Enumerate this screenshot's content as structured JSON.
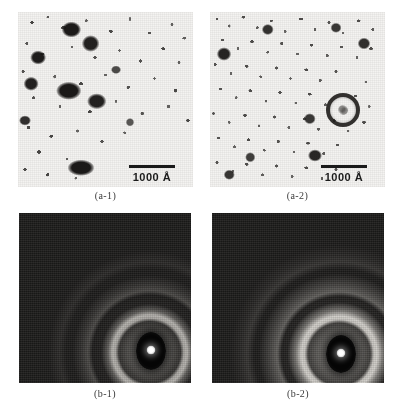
{
  "figure": {
    "type": "micrograph-panel-figure",
    "layout": "2x2",
    "background_color": "#ffffff",
    "panels": [
      {
        "id": "a-1",
        "caption": "(a-1)",
        "kind": "tem-bright-field-micrograph",
        "description": "Bright-field TEM micrograph showing large dark precipitate particles dispersed in a fine speckled matrix",
        "scalebar": {
          "label": "1000 Å",
          "length_value": 1000,
          "length_unit": "Å"
        }
      },
      {
        "id": "a-2",
        "caption": "(a-2)",
        "kind": "tem-bright-field-micrograph",
        "description": "Bright-field TEM micrograph with a finer, more uniform nanocrystalline speckle texture and one hollow ring-shaped particle",
        "scalebar": {
          "label": "1000 Å",
          "length_value": 1000,
          "length_unit": "Å"
        }
      },
      {
        "id": "b-1",
        "caption": "(b-1)",
        "kind": "selected-area-electron-diffraction-pattern",
        "description": "Electron diffraction pattern with faint diffuse halo rings and a beam stop over the transmitted spot"
      },
      {
        "id": "b-2",
        "caption": "(b-2)",
        "kind": "selected-area-electron-diffraction-pattern",
        "description": "Electron diffraction pattern with brighter, more distinct Debye-Scherrer rings and a beam stop over the transmitted spot"
      }
    ],
    "colors": {
      "page_background": "#ffffff",
      "micrograph_background": "#f4f3f1",
      "particle_dark": "#1a1817",
      "diffraction_background": "#1c1b1a",
      "diffraction_ring_bright": "#f2efe9",
      "beamstop_dark": "#050505",
      "transmitted_beam": "#ffffff",
      "caption_text": "#3a3a3a",
      "scalebar": "#1a1a1a"
    }
  }
}
